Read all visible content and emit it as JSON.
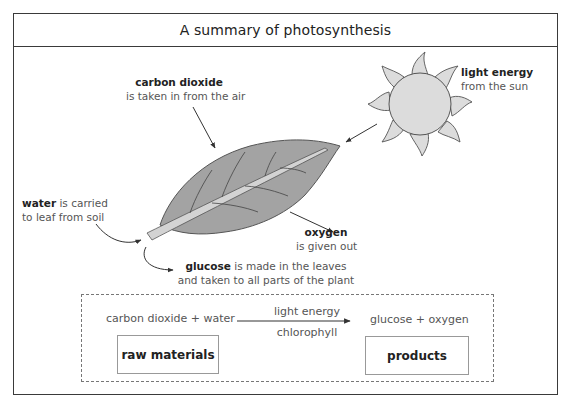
{
  "title": "A summary of photosynthesis",
  "labels": {
    "carbon_dioxide": {
      "bold": "carbon dioxide",
      "line2": "is taken in from the air"
    },
    "light_energy": {
      "bold": "light energy",
      "line2": "from the sun"
    },
    "water": {
      "bold": "water",
      "rest": " is carried",
      "line2": "to leaf from soil"
    },
    "oxygen": {
      "bold": "oxygen",
      "line2": "is given out"
    },
    "glucose": {
      "bold": "glucose",
      "rest": " is made in the leaves",
      "line2": "and taken to all parts of the plant"
    }
  },
  "equation": {
    "reactants": "carbon dioxide + water",
    "condition_above": "light energy",
    "condition_below": "chlorophyll",
    "products": "glucose + oxygen",
    "reactants_box": "raw materials",
    "products_box": "products"
  },
  "icons": {
    "sun": "sun-icon",
    "leaf": "leaf-illustration"
  },
  "colors": {
    "leaf_fill": "#a3a3a3",
    "leaf_vein": "#d0d0d0",
    "sun_fill": "#dcdcdc",
    "line": "#3a3a3a"
  }
}
